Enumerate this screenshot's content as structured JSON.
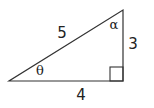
{
  "diagram": {
    "type": "right-triangle",
    "line_color": "#333333",
    "text_color": "#222222",
    "labels": {
      "hypotenuse": "5",
      "base": "4",
      "height": "3",
      "angle_left": "θ",
      "angle_top": "α"
    },
    "right_angle_marker": "bottom-right"
  }
}
